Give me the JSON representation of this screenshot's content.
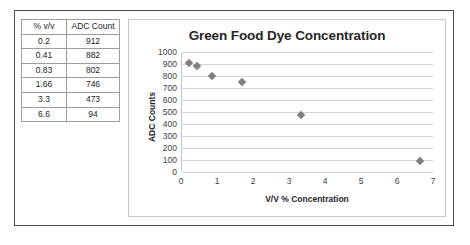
{
  "table": {
    "headers": [
      "% v/v",
      "ADC Count"
    ],
    "rows": [
      [
        "0.2",
        "912"
      ],
      [
        "0.41",
        "882"
      ],
      [
        "0.83",
        "802"
      ],
      [
        "1.66",
        "746"
      ],
      [
        "3.3",
        "473"
      ],
      [
        "6.6",
        "94"
      ]
    ]
  },
  "chart_data": {
    "type": "scatter",
    "title": "Green Food Dye Concentration",
    "xlabel": "V/V % Concentration",
    "ylabel": "ADC Counts",
    "x": [
      0.2,
      0.41,
      0.83,
      1.66,
      3.3,
      6.6
    ],
    "values": [
      912,
      882,
      802,
      746,
      473,
      94
    ],
    "series": [
      {
        "name": "ADC Count",
        "points": [
          {
            "x": 0.2,
            "y": 912
          },
          {
            "x": 0.41,
            "y": 882
          },
          {
            "x": 0.83,
            "y": 802
          },
          {
            "x": 1.66,
            "y": 746
          },
          {
            "x": 3.3,
            "y": 473
          },
          {
            "x": 6.6,
            "y": 94
          }
        ]
      }
    ],
    "xlim": [
      0,
      7
    ],
    "ylim": [
      0,
      1000
    ],
    "xticks": [
      "0",
      "1",
      "2",
      "3",
      "4",
      "5",
      "6",
      "7"
    ],
    "yticks": [
      "1000",
      "900",
      "800",
      "700",
      "600",
      "500",
      "400",
      "300",
      "200",
      "100",
      "0"
    ],
    "grid": "horizontal",
    "legend": "none",
    "marker": "diamond",
    "marker_color": "#808080"
  }
}
